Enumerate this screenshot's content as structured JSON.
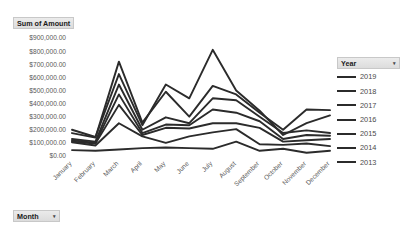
{
  "app": {
    "type": "excel-pivotchart"
  },
  "value_field_button": {
    "label": "Sum of Amount",
    "caret": "▾"
  },
  "axis_field_button": {
    "label": "Month",
    "caret": "▾"
  },
  "legend_field_button": {
    "label": "Year",
    "caret": "▾"
  },
  "legend": {
    "items": [
      {
        "label": "2019",
        "color": "#2b2b2b"
      },
      {
        "label": "2018",
        "color": "#2b2b2b"
      },
      {
        "label": "2017",
        "color": "#2b2b2b"
      },
      {
        "label": "2016",
        "color": "#2b2b2b"
      },
      {
        "label": "2015",
        "color": "#2b2b2b"
      },
      {
        "label": "2014",
        "color": "#2b2b2b"
      },
      {
        "label": "2013",
        "color": "#2b2b2b"
      }
    ]
  },
  "chart_data": {
    "type": "line",
    "title": "Sum of Amount",
    "xlabel": "Month",
    "ylabel": "Sum of Amount",
    "legend_title": "Year",
    "legend_position": "right",
    "grid": false,
    "ylim": [
      0,
      900000
    ],
    "ytick_step": 100000,
    "ytick_labels": [
      "$900,000.00",
      "$800,000.00",
      "$700,000.00",
      "$600,000.00",
      "$500,000.00",
      "$400,000.00",
      "$300,000.00",
      "$200,000.00",
      "$100,000.00",
      "$0.00"
    ],
    "ytick_values": [
      900000,
      800000,
      700000,
      600000,
      500000,
      400000,
      300000,
      200000,
      100000,
      0
    ],
    "categories": [
      "January",
      "February",
      "March",
      "April",
      "May",
      "June",
      "July",
      "August",
      "September",
      "October",
      "November",
      "December"
    ],
    "series": [
      {
        "name": "2019",
        "color": "#2b2b2b",
        "values": [
          175000,
          140000,
          720000,
          255000,
          490000,
          300000,
          535000,
          470000,
          330000,
          200000,
          355000,
          350000
        ]
      },
      {
        "name": "2018",
        "color": "#2b2b2b",
        "values": [
          200000,
          145000,
          625000,
          235000,
          545000,
          440000,
          810000,
          500000,
          345000,
          160000,
          250000,
          310000
        ]
      },
      {
        "name": "2017",
        "color": "#2b2b2b",
        "values": [
          130000,
          110000,
          545000,
          200000,
          295000,
          250000,
          440000,
          425000,
          300000,
          175000,
          195000,
          175000
        ]
      },
      {
        "name": "2016",
        "color": "#2b2b2b",
        "values": [
          120000,
          100000,
          470000,
          175000,
          240000,
          235000,
          355000,
          330000,
          265000,
          130000,
          160000,
          155000
        ]
      },
      {
        "name": "2015",
        "color": "#2b2b2b",
        "values": [
          110000,
          95000,
          390000,
          160000,
          215000,
          210000,
          250000,
          250000,
          215000,
          110000,
          120000,
          130000
        ]
      },
      {
        "name": "2014",
        "color": "#2b2b2b",
        "values": [
          105000,
          80000,
          250000,
          150000,
          100000,
          150000,
          180000,
          205000,
          90000,
          85000,
          95000,
          75000
        ]
      },
      {
        "name": "2013",
        "color": "#2b2b2b",
        "values": [
          45000,
          40000,
          50000,
          60000,
          65000,
          60000,
          55000,
          110000,
          40000,
          55000,
          25000,
          40000
        ]
      }
    ]
  },
  "plot_geometry": {
    "x_left": 72,
    "x_right": 330,
    "y_zero": 156,
    "y_top": 38
  }
}
